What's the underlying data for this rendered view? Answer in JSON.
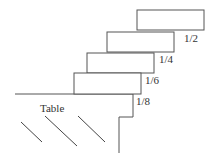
{
  "diagram": {
    "type": "stacked-blocks-overhang",
    "table_label": "Table",
    "blocks": [
      {
        "x": 137,
        "y": 10,
        "w": 67,
        "h": 20,
        "overhang_label": "1/2"
      },
      {
        "x": 107,
        "y": 32,
        "w": 67,
        "h": 20,
        "overhang_label": "1/4"
      },
      {
        "x": 87,
        "y": 53,
        "w": 67,
        "h": 20,
        "overhang_label": "1/6"
      },
      {
        "x": 74,
        "y": 73,
        "w": 67,
        "h": 21,
        "overhang_label": "1/8"
      }
    ],
    "colors": {
      "stroke": "#555555",
      "background": "#ffffff"
    }
  }
}
